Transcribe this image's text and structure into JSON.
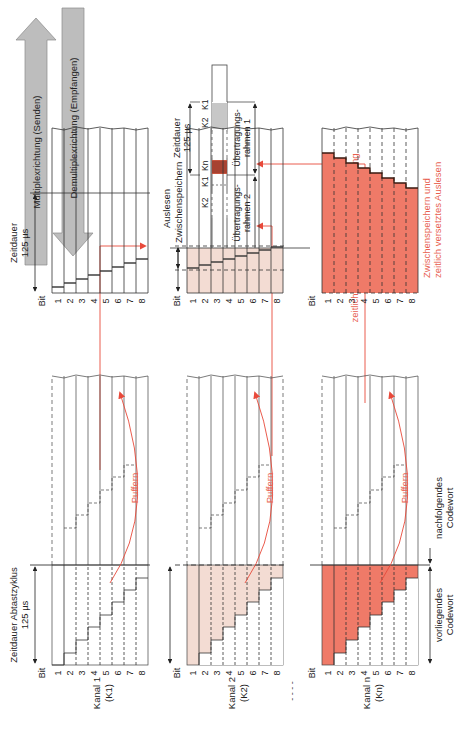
{
  "colors": {
    "red": "#e8493a",
    "red_fill": "#ef7a68",
    "light_fill": "#f3dcd3",
    "line": "#333333",
    "arrow_gray": "#bdbdbd",
    "text_red": "#e8604f"
  },
  "directions": {
    "multiplex": "Multiplexrichtung (Senden)",
    "demultiplex": "Demultiplexrichtung (Empfangen)"
  },
  "sampling": {
    "title_line1": "Zeitdauer Abtastzyklus",
    "title_line2": "125 µs",
    "current_codeword_line1": "vorliegendes",
    "current_codeword_line2": "Codewort",
    "next_codeword_line1": "nachfolgendes",
    "next_codeword_line2": "Codewort"
  },
  "buffer_label": "Puffern",
  "bit_label": "Bit",
  "bits": [
    "1",
    "2",
    "3",
    "4",
    "5",
    "6",
    "7",
    "8"
  ],
  "channels": [
    {
      "name_line1": "Kanal 1",
      "name_line2": "(K1)"
    },
    {
      "name_line1": "Kanal 2",
      "name_line2": "(K2)"
    },
    {
      "name_line1": "Kanal n",
      "name_line2": "(Kn)"
    }
  ],
  "readout": {
    "duration_line1": "Zeitdauer",
    "duration_line2": "125 µs",
    "readout_label": "Auslesen",
    "intermediate_label": "Zwischenspeichern",
    "shifted_line1": "Zwischenspeichern und",
    "shifted_line2": "zeitlich versetztes Auslesen"
  },
  "frames": {
    "duration_line1": "Zeitdauer",
    "duration_line2": "125 µs",
    "slots": [
      "K1",
      "K2",
      "Kn",
      "K1",
      "K2"
    ],
    "frame1_line1": "Übertragungs-",
    "frame1_line2": "rahmen 1",
    "frame2_line1": "Übertragungs-",
    "frame2_line2": "rahmen 2",
    "sequential_label": "zeitlich aneinandergereihte Übertragung"
  },
  "ellipsis": "- - - -"
}
